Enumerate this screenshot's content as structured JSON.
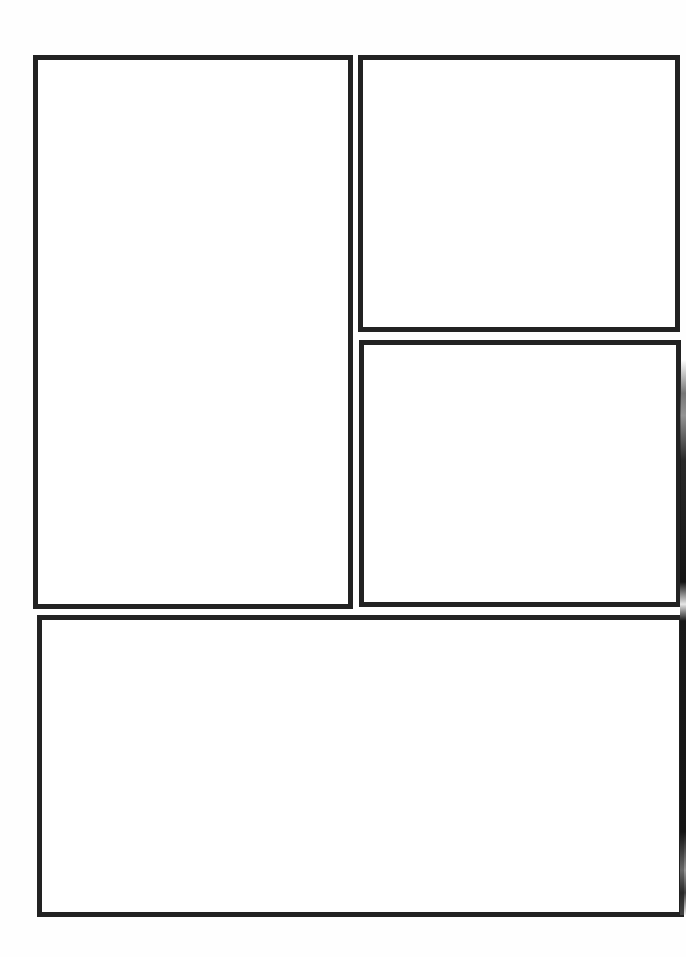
{
  "page": {
    "type": "blank comic page layout",
    "background_color": "#ffffff",
    "border_color": "#222222"
  },
  "panels": [
    {
      "id": "panel-1",
      "position": "left-tall",
      "label": ""
    },
    {
      "id": "panel-2",
      "position": "top-right",
      "label": ""
    },
    {
      "id": "panel-3",
      "position": "middle-right",
      "label": ""
    },
    {
      "id": "panel-4",
      "position": "bottom-wide",
      "label": ""
    }
  ]
}
